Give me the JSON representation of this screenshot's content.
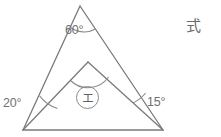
{
  "figure": {
    "type": "geometry-diagram",
    "stroke_color": "#7a7a7a",
    "background_color": "#ffffff",
    "points": {
      "base_left": {
        "x": 23,
        "y": 130
      },
      "base_right": {
        "x": 163,
        "y": 130
      },
      "outer_apex": {
        "x": 80,
        "y": 6
      },
      "inner_apex": {
        "x": 88,
        "y": 62
      }
    },
    "labels": {
      "apex_angle": "60°",
      "left_angle": "20°",
      "right_angle": "15°",
      "unknown_angle": "エ",
      "side_note": "式"
    }
  }
}
